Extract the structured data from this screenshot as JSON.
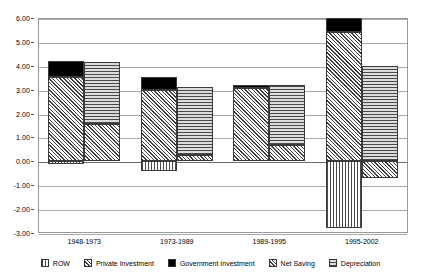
{
  "chart_data": {
    "type": "bar",
    "title": "",
    "subtitle": "",
    "xlabel": "",
    "ylabel": "",
    "ylim": [
      -3.0,
      6.0
    ],
    "ytick_step": 1.0,
    "ytick_labels": [
      "6.00",
      "5.00",
      "4.00",
      "3.00",
      "2.00",
      "1.00",
      "0.00",
      "-1.00",
      "-2.00",
      "-3.00"
    ],
    "ytick_values": [
      6.0,
      5.0,
      4.0,
      3.0,
      2.0,
      1.0,
      0.0,
      -1.0,
      -2.0,
      -3.0
    ],
    "grid": true,
    "stacked": true,
    "paired_bars": true,
    "legend_position": "bottom",
    "categories": [
      "1948-1973",
      "1973-1989",
      "1989-1995",
      "1995-2002"
    ],
    "series": [
      {
        "name": "ROW",
        "pattern": "vertical-stripes",
        "bar": "left",
        "values": [
          -0.1,
          -0.4,
          0.0,
          -2.8
        ]
      },
      {
        "name": "Private Investment",
        "pattern": "diagonal-hatch",
        "bar": "left",
        "values": [
          3.55,
          3.0,
          3.08,
          5.42
        ]
      },
      {
        "name": "Government Investment",
        "pattern": "solid-black",
        "bar": "left",
        "values": [
          0.65,
          0.55,
          0.1,
          0.56
        ]
      },
      {
        "name": "Net Saving",
        "pattern": "cross-hatch",
        "bar": "right",
        "values": [
          1.55,
          0.27,
          0.7,
          -0.7
        ]
      },
      {
        "name": "Depreciation",
        "pattern": "horizontal-stripes",
        "bar": "right",
        "values": [
          2.6,
          2.86,
          2.49,
          3.97
        ]
      }
    ],
    "group_totals": {
      "left_bar_top": [
        4.2,
        3.55,
        3.18,
        5.98
      ],
      "left_bar_bottom": [
        -0.1,
        -0.4,
        0.0,
        -2.8
      ],
      "right_bar_top": [
        4.15,
        3.13,
        3.19,
        3.97
      ],
      "right_bar_bottom": [
        0.0,
        0.0,
        0.0,
        -0.7
      ]
    }
  },
  "legend": {
    "items": [
      {
        "label": "ROW",
        "swatch": "vertical-stripes-swatch"
      },
      {
        "label": "Private Investment",
        "swatch": "diagonal-hatch-swatch"
      },
      {
        "label": "Government Investment",
        "swatch": "solid-black-swatch"
      },
      {
        "label": "Net Saving",
        "swatch": "cross-hatch-swatch"
      },
      {
        "label": "Depreciation",
        "swatch": "horizontal-stripes-swatch"
      }
    ]
  },
  "colors": {
    "grid": "#a8a8a8",
    "zero_line": "#6d6d6d",
    "frame": "#9a9a9a",
    "bar_outline": "#3a3a3a",
    "government_fill": "#000000",
    "background": "#ffffff"
  }
}
